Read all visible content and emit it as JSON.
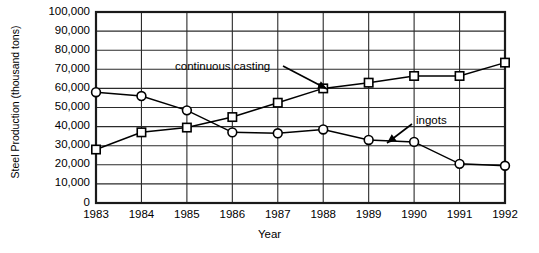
{
  "chart_data": {
    "type": "line",
    "title": "",
    "xlabel": "Year",
    "ylabel": "Steel Production (thousand tons)",
    "x": [
      1983,
      1984,
      1985,
      1986,
      1987,
      1988,
      1989,
      1990,
      1991,
      1992
    ],
    "xtick_labels": [
      "1983",
      "1984",
      "1985",
      "1986",
      "1987",
      "1988",
      "1989",
      "1990",
      "1991",
      "1992"
    ],
    "ytick_labels": [
      "100,000",
      "90,000",
      "80,000",
      "70,000",
      "60,000",
      "50,000",
      "40,000",
      "30,000",
      "20,000",
      "10,000",
      "0"
    ],
    "ytick_values": [
      100000,
      90000,
      80000,
      70000,
      60000,
      50000,
      40000,
      30000,
      20000,
      10000,
      0
    ],
    "ylim": [
      0,
      100000
    ],
    "xlim": [
      1983,
      1992
    ],
    "grid": "both",
    "legend_position": "annotations-inline",
    "series": [
      {
        "name": "continuous casting",
        "marker": "square",
        "color": "#000000",
        "values": [
          28000,
          37000,
          39500,
          45000,
          52500,
          60000,
          63000,
          66500,
          66500,
          73500
        ]
      },
      {
        "name": "ingots",
        "marker": "circle",
        "color": "#000000",
        "values": [
          58000,
          56000,
          48500,
          37000,
          36500,
          38500,
          33000,
          32000,
          20500,
          19500
        ]
      }
    ],
    "annotations": [
      {
        "text": "continuous casting",
        "label_x": 175,
        "label_y": 60,
        "arrow_from_x": 283,
        "arrow_from_y": 66,
        "arrow_to_x": 327,
        "arrow_to_y": 89
      },
      {
        "text": "ingots",
        "label_x": 416,
        "label_y": 114,
        "arrow_from_x": 412,
        "arrow_from_y": 124,
        "arrow_to_x": 387,
        "arrow_to_y": 143
      }
    ]
  }
}
